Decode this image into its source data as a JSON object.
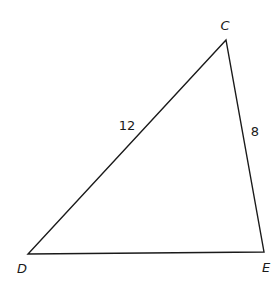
{
  "diagram": {
    "type": "triangle",
    "vertices": [
      {
        "id": "C",
        "label": "C",
        "x": 226,
        "y": 40,
        "label_x": 225,
        "label_y": 30
      },
      {
        "id": "D",
        "label": "D",
        "x": 28,
        "y": 254,
        "label_x": 22,
        "label_y": 273
      },
      {
        "id": "E",
        "label": "E",
        "x": 264,
        "y": 252,
        "label_x": 266,
        "label_y": 272
      }
    ],
    "sides": [
      {
        "id": "DC",
        "from": "D",
        "to": "C",
        "label": "12",
        "label_x": 127,
        "label_y": 130
      },
      {
        "id": "CE",
        "from": "C",
        "to": "E",
        "label": "8",
        "label_x": 255,
        "label_y": 136
      },
      {
        "id": "DE",
        "from": "D",
        "to": "E",
        "label": ""
      }
    ],
    "colors": {
      "stroke": "#1a1a1a",
      "background": "#ffffff"
    }
  }
}
